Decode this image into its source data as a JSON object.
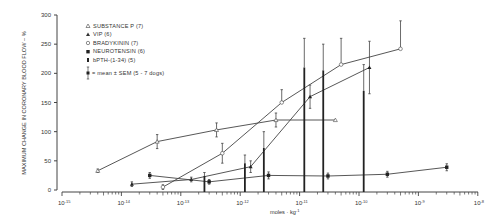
{
  "chart_data": {
    "type": "line",
    "title": "",
    "xlabel": "moles · kg⁻¹",
    "ylabel": "MAXIMUM CHANGE IN CORONARY BLOOD FLOW – %",
    "xscale": "log",
    "xlim": [
      1e-15,
      1e-08
    ],
    "ylim": [
      0,
      300
    ],
    "grid": false,
    "legend_position": "upper-left",
    "x_tick_labels": [
      "10⁻¹⁵",
      "10⁻¹⁴",
      "10⁻¹³",
      "10⁻¹²",
      "10⁻¹¹",
      "10⁻¹⁰",
      "10⁻⁹",
      "10⁻⁸"
    ],
    "y_tick_labels": [
      "0",
      "50",
      "100",
      "150",
      "200",
      "250",
      "300"
    ],
    "series": [
      {
        "name": "SUBSTANCE P (7)",
        "marker": "open-triangle",
        "x": [
          4e-15,
          4e-14,
          4e-13,
          4e-12,
          4e-11
        ],
        "y": [
          33,
          83,
          103,
          120,
          120
        ],
        "sem": [
          3,
          12,
          12,
          12,
          0
        ]
      },
      {
        "name": "VIP (6)",
        "marker": "filled-triangle",
        "x": [
          1.5e-14,
          1.5e-13,
          1.5e-12,
          1.5e-11,
          1.5e-10
        ],
        "y": [
          10,
          18,
          40,
          160,
          210
        ],
        "sem": [
          4,
          4,
          10,
          20,
          45
        ]
      },
      {
        "name": "BRADYKININ (7)",
        "marker": "open-circle",
        "x": [
          5e-14,
          5e-13,
          5e-12,
          5e-11,
          5e-10
        ],
        "y": [
          5,
          63,
          150,
          215,
          242
        ],
        "sem": [
          4,
          17,
          22,
          45,
          48
        ]
      },
      {
        "name": "NEUROTENSIN (6)",
        "marker": "filled-square",
        "x": [
          3e-14,
          3e-13,
          3e-12,
          3e-11,
          3e-10,
          3e-09
        ],
        "y": [
          25,
          14,
          25,
          24,
          27,
          39
        ],
        "sem": [
          5,
          4,
          6,
          5,
          5,
          6
        ]
      },
      {
        "name": "bPTH-(1-34) (5)",
        "marker": "bar",
        "x": [
          2.5e-13,
          1.2e-12,
          2.5e-12,
          1.2e-11,
          2.5e-11,
          1.2e-10
        ],
        "y": [
          24,
          46,
          72,
          210,
          205,
          170
        ],
        "sem": [
          6,
          14,
          28,
          50,
          45,
          45
        ]
      }
    ],
    "note": "■ = mean ± SEM (5 - 7 dogs)"
  },
  "legend": {
    "items": [
      {
        "symbol": "△",
        "label": "SUBSTANCE P (7)"
      },
      {
        "symbol": "▲",
        "label": "VIP (6)"
      },
      {
        "symbol": "○",
        "label": "BRADYKININ (7)"
      },
      {
        "symbol": "■",
        "label": "NEUROTENSIN (6)"
      },
      {
        "symbol": "▮",
        "label": "bPTH-(1-34) (5)"
      }
    ],
    "note": "= mean ± SEM (5 - 7 dogs)"
  },
  "axes": {
    "ylabel": "MAXIMUM CHANGE IN CORONARY BLOOD FLOW – %",
    "xlabel": "moles · kg",
    "xlabel_exp": "-1",
    "yticks": [
      "300",
      "250",
      "200",
      "150",
      "100",
      "50",
      "0"
    ],
    "xticks": [
      {
        "base": "10",
        "exp": "-15"
      },
      {
        "base": "10",
        "exp": "-14"
      },
      {
        "base": "10",
        "exp": "-13"
      },
      {
        "base": "10",
        "exp": "-12"
      },
      {
        "base": "10",
        "exp": "-11"
      },
      {
        "base": "10",
        "exp": "-10"
      },
      {
        "base": "10",
        "exp": "-9"
      },
      {
        "base": "10",
        "exp": "-8"
      }
    ]
  }
}
